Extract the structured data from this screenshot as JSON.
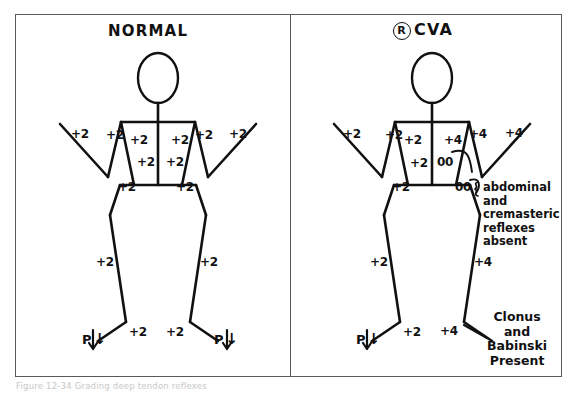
{
  "panels": [
    {
      "id": "normal",
      "title": "NORMAL",
      "has_circled_r": false,
      "reflex_markers": [
        {
          "name": "left-outer-arm-reflex",
          "value": "+2",
          "x": 71,
          "y": 127
        },
        {
          "name": "left-biceps-reflex",
          "value": "+2",
          "x": 106,
          "y": 128
        },
        {
          "name": "left-inner-arm-reflex",
          "value": "+2",
          "x": 130,
          "y": 133
        },
        {
          "name": "right-inner-arm-reflex",
          "value": "+2",
          "x": 171,
          "y": 133
        },
        {
          "name": "right-biceps-reflex",
          "value": "+2",
          "x": 195,
          "y": 128
        },
        {
          "name": "right-outer-arm-reflex",
          "value": "+2",
          "x": 229,
          "y": 127
        },
        {
          "name": "left-trunk-reflex",
          "value": "+2",
          "x": 137,
          "y": 155
        },
        {
          "name": "right-trunk-reflex",
          "value": "+2",
          "x": 166,
          "y": 155
        },
        {
          "name": "left-hip-reflex",
          "value": "+2",
          "x": 118,
          "y": 180
        },
        {
          "name": "right-hip-reflex",
          "value": "+2",
          "x": 176,
          "y": 180
        },
        {
          "name": "left-knee-reflex",
          "value": "+2",
          "x": 96,
          "y": 255
        },
        {
          "name": "right-knee-reflex",
          "value": "+2",
          "x": 200,
          "y": 255
        },
        {
          "name": "left-ankle-reflex",
          "value": "+2",
          "x": 129,
          "y": 325
        },
        {
          "name": "right-ankle-reflex",
          "value": "+2",
          "x": 166,
          "y": 325
        }
      ],
      "plantar_responses": [
        {
          "name": "left-plantar-response",
          "label": "P",
          "arrow": "↓",
          "x": 82,
          "y": 330
        },
        {
          "name": "right-plantar-response",
          "label": "P",
          "arrow": "↓",
          "x": 214,
          "y": 330
        }
      ],
      "annotations": []
    },
    {
      "id": "right-cva",
      "title": "CVA",
      "has_circled_r": true,
      "circled_r_letter": "R",
      "reflex_markers": [
        {
          "name": "left-outer-arm-reflex",
          "value": "+2",
          "x": 343,
          "y": 127
        },
        {
          "name": "left-biceps-reflex",
          "value": "+2",
          "x": 385,
          "y": 128
        },
        {
          "name": "left-inner-arm-reflex",
          "value": "+2",
          "x": 404,
          "y": 133
        },
        {
          "name": "right-inner-arm-reflex",
          "value": "+4",
          "x": 444,
          "y": 133
        },
        {
          "name": "right-biceps-reflex",
          "value": "+4",
          "x": 469,
          "y": 127
        },
        {
          "name": "right-outer-arm-reflex",
          "value": "+4",
          "x": 505,
          "y": 126
        },
        {
          "name": "left-trunk-reflex",
          "value": "+2",
          "x": 410,
          "y": 156
        },
        {
          "name": "left-hip-reflex",
          "value": "+2",
          "x": 392,
          "y": 180
        },
        {
          "name": "left-knee-reflex",
          "value": "+2",
          "x": 370,
          "y": 255
        },
        {
          "name": "right-knee-reflex",
          "value": "+4",
          "x": 474,
          "y": 255
        },
        {
          "name": "left-ankle-reflex",
          "value": "+2",
          "x": 403,
          "y": 325
        },
        {
          "name": "right-ankle-reflex",
          "value": "+4",
          "x": 440,
          "y": 324
        }
      ],
      "absent_reflex_markers": [
        {
          "name": "upper-abdominal-reflex-absent",
          "value": "00",
          "x": 437,
          "y": 155
        },
        {
          "name": "lower-abdominal-reflex-absent",
          "value": "00",
          "x": 455,
          "y": 180
        }
      ],
      "plantar_responses": [
        {
          "name": "left-plantar-response",
          "label": "P",
          "arrow": "↓",
          "x": 356,
          "y": 330
        }
      ],
      "annotations": [
        {
          "name": "abdominal-cremasteric-annotation",
          "lines": [
            "abdominal",
            "and",
            "cremasteric",
            "reflexes",
            "absent"
          ]
        },
        {
          "name": "clonus-babinski-annotation",
          "lines": [
            "Clonus",
            "and",
            "Babinski",
            "Present"
          ]
        }
      ]
    }
  ],
  "caption": {
    "text": "Figure 12-34   Grading deep tendon reflexes"
  },
  "colors": {
    "ink": "#111111",
    "frame": "#5a5a5a",
    "paper": "#ffffff"
  }
}
